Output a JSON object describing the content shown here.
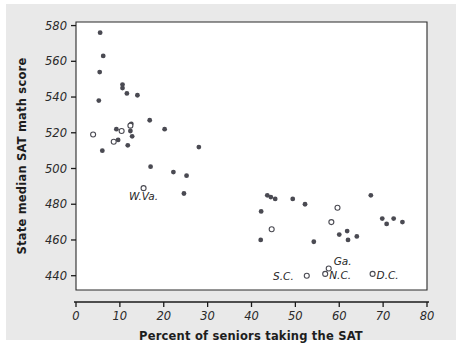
{
  "chart_data": {
    "type": "scatter",
    "title": "",
    "xlabel": "Percent of seniors taking the SAT",
    "ylabel": "State median SAT math score",
    "xlim": [
      0,
      80
    ],
    "ylim": [
      432,
      582
    ],
    "grid": false,
    "legend": "none",
    "xticks": [
      0,
      10,
      20,
      30,
      40,
      50,
      60,
      70,
      80
    ],
    "yticks": [
      440,
      460,
      480,
      500,
      520,
      540,
      560,
      580
    ],
    "xtick_labels": [
      "0",
      "10",
      "20",
      "30",
      "40",
      "50",
      "60",
      "70",
      "80"
    ],
    "ytick_labels": [
      "440",
      "460",
      "480",
      "500",
      "520",
      "540",
      "560",
      "580"
    ],
    "marker_styles": {
      "filled": "solid dark circle",
      "open": "open circle (labeled / highlighted states)"
    },
    "points": [
      {
        "x": 5.5,
        "y": 576,
        "style": "filled"
      },
      {
        "x": 6.2,
        "y": 563,
        "style": "filled"
      },
      {
        "x": 5.4,
        "y": 554,
        "style": "filled"
      },
      {
        "x": 5.2,
        "y": 538,
        "style": "filled"
      },
      {
        "x": 10.6,
        "y": 547,
        "style": "filled"
      },
      {
        "x": 10.6,
        "y": 545,
        "style": "filled"
      },
      {
        "x": 11.6,
        "y": 542,
        "style": "filled"
      },
      {
        "x": 14.0,
        "y": 541,
        "style": "filled"
      },
      {
        "x": 12.6,
        "y": 525,
        "style": "filled"
      },
      {
        "x": 12.4,
        "y": 524,
        "style": "open"
      },
      {
        "x": 9.2,
        "y": 522,
        "style": "filled"
      },
      {
        "x": 10.4,
        "y": 521,
        "style": "open"
      },
      {
        "x": 12.4,
        "y": 521,
        "style": "filled"
      },
      {
        "x": 16.8,
        "y": 527,
        "style": "filled"
      },
      {
        "x": 20.2,
        "y": 522,
        "style": "filled"
      },
      {
        "x": 12.8,
        "y": 518,
        "style": "filled"
      },
      {
        "x": 9.6,
        "y": 516,
        "style": "filled"
      },
      {
        "x": 3.9,
        "y": 519,
        "style": "open"
      },
      {
        "x": 8.6,
        "y": 515,
        "style": "open"
      },
      {
        "x": 11.8,
        "y": 513,
        "style": "filled"
      },
      {
        "x": 6.0,
        "y": 510,
        "style": "filled"
      },
      {
        "x": 28.0,
        "y": 512,
        "style": "filled"
      },
      {
        "x": 17.0,
        "y": 501,
        "style": "filled"
      },
      {
        "x": 22.2,
        "y": 498,
        "style": "filled"
      },
      {
        "x": 25.2,
        "y": 496,
        "style": "filled"
      },
      {
        "x": 15.4,
        "y": 489,
        "style": "open",
        "label": "W.Va."
      },
      {
        "x": 24.6,
        "y": 486,
        "style": "filled"
      },
      {
        "x": 43.6,
        "y": 485,
        "style": "filled"
      },
      {
        "x": 44.4,
        "y": 484,
        "style": "filled"
      },
      {
        "x": 45.4,
        "y": 483,
        "style": "filled"
      },
      {
        "x": 49.4,
        "y": 483,
        "style": "filled"
      },
      {
        "x": 52.2,
        "y": 480,
        "style": "filled"
      },
      {
        "x": 42.2,
        "y": 476,
        "style": "filled"
      },
      {
        "x": 44.6,
        "y": 466,
        "style": "open"
      },
      {
        "x": 42.1,
        "y": 460,
        "style": "filled"
      },
      {
        "x": 54.2,
        "y": 459,
        "style": "filled"
      },
      {
        "x": 59.6,
        "y": 478,
        "style": "open"
      },
      {
        "x": 58.2,
        "y": 470,
        "style": "open"
      },
      {
        "x": 60.0,
        "y": 463,
        "style": "filled"
      },
      {
        "x": 61.8,
        "y": 465,
        "style": "filled"
      },
      {
        "x": 62.0,
        "y": 460,
        "style": "filled"
      },
      {
        "x": 64.0,
        "y": 462,
        "style": "filled"
      },
      {
        "x": 67.2,
        "y": 485,
        "style": "filled"
      },
      {
        "x": 69.8,
        "y": 472,
        "style": "filled"
      },
      {
        "x": 70.8,
        "y": 469,
        "style": "filled"
      },
      {
        "x": 72.4,
        "y": 472,
        "style": "filled"
      },
      {
        "x": 74.4,
        "y": 470,
        "style": "filled"
      },
      {
        "x": 52.6,
        "y": 440,
        "style": "open",
        "label": "S.C."
      },
      {
        "x": 56.8,
        "y": 441,
        "style": "open",
        "label": "N.C."
      },
      {
        "x": 57.6,
        "y": 444,
        "style": "open",
        "label": "Ga."
      },
      {
        "x": 67.6,
        "y": 441,
        "style": "open",
        "label": "D.C."
      }
    ],
    "annotations": [
      {
        "text": "W.Va.",
        "x": 15.4,
        "y": 489,
        "dx": 0,
        "dy": 12,
        "anchor": "middle"
      },
      {
        "text": "S.C.",
        "x": 52.6,
        "y": 440,
        "dx": -13,
        "dy": 4,
        "anchor": "end"
      },
      {
        "text": "N.C.",
        "x": 56.8,
        "y": 441,
        "dx": 4,
        "dy": 5,
        "anchor": "start"
      },
      {
        "text": "Ga.",
        "x": 57.6,
        "y": 444,
        "dx": 5,
        "dy": -4,
        "anchor": "start"
      },
      {
        "text": "D.C.",
        "x": 67.6,
        "y": 441,
        "dx": 4,
        "dy": 5,
        "anchor": "start"
      }
    ]
  }
}
